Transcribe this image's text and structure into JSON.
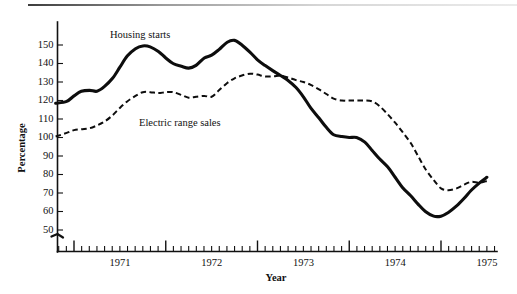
{
  "figure": {
    "xlabel": "Year",
    "ylabel": "Percentage"
  },
  "axis": {
    "y_ticks": [
      150,
      140,
      130,
      120,
      110,
      100,
      90,
      80,
      70,
      60,
      50
    ],
    "x_ticks": [
      "1971",
      "1972",
      "1973",
      "1974",
      "1975"
    ],
    "y_break_marker": "axis-break"
  },
  "annotations": {
    "solid_label": "Housing starts",
    "dashed_label": "Electric range sales"
  },
  "chart_data": {
    "type": "line",
    "title": "",
    "xlabel": "Year",
    "ylabel": "Percentage",
    "xlim": [
      1970.75,
      1975.6
    ],
    "ylim": [
      45,
      157
    ],
    "ytick_values": [
      50,
      60,
      70,
      80,
      90,
      100,
      110,
      120,
      130,
      140,
      150
    ],
    "xtick_labels": [
      "1971",
      "1972",
      "1973",
      "1974",
      "1975"
    ],
    "xtick_positions": [
      1971.5,
      1972.5,
      1973.5,
      1974.5,
      1975.5
    ],
    "year_boundaries": [
      1971.0,
      1972.0,
      1973.0,
      1974.0,
      1975.0
    ],
    "minor_ticks": "monthly",
    "grid": false,
    "legend": "inline-annotations",
    "series": [
      {
        "name": "Housing starts",
        "style": "solid",
        "color": "#0d0d0d",
        "x": [
          1970.8,
          1970.92,
          1971.0,
          1971.08,
          1971.17,
          1971.25,
          1971.33,
          1971.42,
          1971.5,
          1971.58,
          1971.67,
          1971.75,
          1971.83,
          1971.92,
          1972.0,
          1972.08,
          1972.17,
          1972.25,
          1972.33,
          1972.42,
          1972.5,
          1972.58,
          1972.67,
          1972.75,
          1972.83,
          1972.92,
          1973.0,
          1973.08,
          1973.17,
          1973.25,
          1973.33,
          1973.42,
          1973.5,
          1973.58,
          1973.67,
          1973.75,
          1973.83,
          1973.92,
          1974.0,
          1974.08,
          1974.17,
          1974.25,
          1974.33,
          1974.42,
          1974.5,
          1974.58,
          1974.67,
          1974.75,
          1974.83,
          1974.92,
          1975.0,
          1975.08,
          1975.17,
          1975.25,
          1975.33,
          1975.42,
          1975.5
        ],
        "y": [
          118.5,
          119.5,
          122.5,
          125.0,
          125.5,
          125.0,
          127.5,
          132.0,
          138.0,
          144.0,
          148.0,
          149.5,
          149.0,
          146.5,
          143.0,
          140.0,
          138.5,
          137.5,
          139.0,
          143.0,
          144.5,
          147.5,
          151.5,
          152.5,
          150.0,
          146.0,
          142.0,
          139.0,
          136.0,
          133.5,
          131.0,
          127.0,
          122.0,
          116.0,
          110.5,
          105.5,
          101.5,
          100.5,
          100.0,
          100.0,
          97.5,
          93.0,
          88.5,
          84.0,
          78.5,
          73.0,
          68.5,
          64.0,
          60.0,
          57.5,
          57.5,
          59.5,
          63.0,
          67.0,
          71.5,
          75.5,
          78.5
        ]
      },
      {
        "name": "Electric range sales",
        "style": "dashed",
        "color": "#0d0d0d",
        "x": [
          1970.8,
          1970.92,
          1971.0,
          1971.08,
          1971.17,
          1971.25,
          1971.33,
          1971.42,
          1971.5,
          1971.58,
          1971.67,
          1971.75,
          1971.83,
          1971.92,
          1972.0,
          1972.08,
          1972.17,
          1972.25,
          1972.33,
          1972.42,
          1972.5,
          1972.58,
          1972.67,
          1972.75,
          1972.83,
          1972.92,
          1973.0,
          1973.08,
          1973.17,
          1973.25,
          1973.33,
          1973.42,
          1973.5,
          1973.58,
          1973.67,
          1973.75,
          1973.83,
          1973.92,
          1974.0,
          1974.08,
          1974.17,
          1974.25,
          1974.33,
          1974.42,
          1974.5,
          1974.58,
          1974.67,
          1974.75,
          1974.83,
          1974.92,
          1975.0,
          1975.08,
          1975.17,
          1975.25,
          1975.33,
          1975.42,
          1975.5
        ],
        "y": [
          100.5,
          102.5,
          104.0,
          104.5,
          105.0,
          106.5,
          108.5,
          112.0,
          116.0,
          119.5,
          122.5,
          124.5,
          124.5,
          124.0,
          124.5,
          124.5,
          123.0,
          121.5,
          122.0,
          122.5,
          122.0,
          125.5,
          129.5,
          132.0,
          133.5,
          134.5,
          134.0,
          133.0,
          133.0,
          133.5,
          132.5,
          131.0,
          130.0,
          128.5,
          126.0,
          123.5,
          121.0,
          120.0,
          120.0,
          120.0,
          120.0,
          119.5,
          117.0,
          112.5,
          108.0,
          103.0,
          97.0,
          90.0,
          83.0,
          77.0,
          72.5,
          71.5,
          72.5,
          74.5,
          76.0,
          75.5,
          76.5
        ]
      }
    ]
  }
}
